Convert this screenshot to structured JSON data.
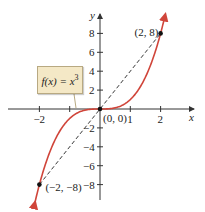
{
  "chart_data": {
    "type": "line",
    "title": "",
    "function_label": "f(x) = x^3",
    "function_label_parts": {
      "lhs": "f(x) = x",
      "exp": "3"
    },
    "xlabel": "x",
    "ylabel": "y",
    "xlim": [
      -3,
      3
    ],
    "ylim": [
      -10,
      10
    ],
    "x_ticks": [
      -2,
      -1,
      1,
      2
    ],
    "x_tick_labels": [
      "-2",
      "1",
      "2"
    ],
    "y_ticks": [
      -8,
      -6,
      -4,
      -2,
      2,
      4,
      6,
      8
    ],
    "y_tick_labels": [
      "8",
      "6",
      "4",
      "2",
      "-2",
      "-4",
      "-6",
      "-8"
    ],
    "series": [
      {
        "name": "f(x) = x^3",
        "color": "#d0453a",
        "style": "solid",
        "x": [
          -2.15,
          -2,
          -1.5,
          -1,
          -0.5,
          0,
          0.5,
          1,
          1.5,
          2,
          2.15
        ],
        "y": [
          -9.94,
          -8,
          -3.375,
          -1,
          -0.125,
          0,
          0.125,
          1,
          3.375,
          8,
          9.94
        ]
      },
      {
        "name": "secant line",
        "color": "#222222",
        "style": "dashed",
        "x": [
          -2,
          2
        ],
        "y": [
          -8,
          8
        ]
      }
    ],
    "points": [
      {
        "label": "(2, 8)",
        "x": 2,
        "y": 8
      },
      {
        "label": "(0, 0)",
        "x": 0,
        "y": 0
      },
      {
        "label": "(-2, -8)",
        "x": -2,
        "y": -8
      }
    ],
    "grid": false,
    "legend": "callout box"
  }
}
